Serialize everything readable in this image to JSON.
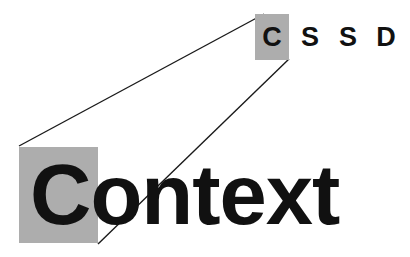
{
  "diagram": {
    "type": "acronym-expansion-callout",
    "background_color": "#ffffff",
    "highlight_color": "#adadad",
    "text_color": "#111111",
    "line_color": "#1a1a1a"
  },
  "acronym": {
    "full_text": "C S S D",
    "letters": [
      {
        "char": "C",
        "highlighted": true
      },
      {
        "char": "S",
        "highlighted": false
      },
      {
        "char": "S",
        "highlighted": false
      },
      {
        "char": "D",
        "highlighted": false
      }
    ]
  },
  "expansion": {
    "word": "Context",
    "initial": "C",
    "highlighted_initial": true
  },
  "connectors": [
    {
      "name": "upper-connector",
      "from_x": 264,
      "from_y": 14,
      "to_x": 19,
      "to_y": 146
    },
    {
      "name": "lower-connector",
      "from_x": 289,
      "from_y": 59,
      "to_x": 98,
      "to_y": 244
    }
  ]
}
